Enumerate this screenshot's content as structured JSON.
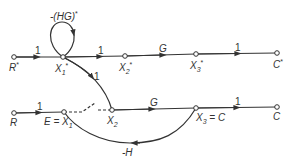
{
  "diagram": {
    "type": "signal-flow-graph",
    "top_graph": {
      "nodes": [
        {
          "id": "R*",
          "label": "R*"
        },
        {
          "id": "X1*",
          "label": "X1*"
        },
        {
          "id": "X2*",
          "label": "X2*"
        },
        {
          "id": "X3*",
          "label": "X3*"
        },
        {
          "id": "C*",
          "label": "C*"
        }
      ],
      "edges": [
        {
          "from": "R*",
          "to": "X1*",
          "gain": "1"
        },
        {
          "from": "X1*",
          "to": "X1*",
          "gain": "-(HG)*",
          "kind": "self-loop"
        },
        {
          "from": "X1*",
          "to": "X2*",
          "gain": "1"
        },
        {
          "from": "X2*",
          "to": "X3*",
          "gain": "G"
        },
        {
          "from": "X3*",
          "to": "C*",
          "gain": "1"
        },
        {
          "from": "X1*",
          "to": "X2",
          "gain": "1",
          "kind": "sampler-link"
        }
      ]
    },
    "bottom_graph": {
      "nodes": [
        {
          "id": "R",
          "label": "R"
        },
        {
          "id": "E=X1",
          "label": "E = X1"
        },
        {
          "id": "X2",
          "label": "X2"
        },
        {
          "id": "X3=C",
          "label": "X3 = C"
        },
        {
          "id": "C",
          "label": "C"
        }
      ],
      "edges": [
        {
          "from": "R",
          "to": "E=X1",
          "gain": "1"
        },
        {
          "from": "E=X1",
          "to": "X2",
          "gain": "",
          "kind": "sampler-switch-dashed"
        },
        {
          "from": "X2",
          "to": "X3=C",
          "gain": "G"
        },
        {
          "from": "X3=C",
          "to": "C",
          "gain": "1"
        },
        {
          "from": "X3=C",
          "to": "E=X1",
          "gain": "-H",
          "kind": "feedback"
        }
      ]
    },
    "labels": {
      "loop_gain": "-(HG)",
      "gain_1": "1",
      "gain_G": "G",
      "gain_negH": "-H",
      "R_star": "R",
      "X1_star": "X",
      "X2_star": "X",
      "X3_star": "X",
      "C_star": "C",
      "R": "R",
      "E_X1": "E = X",
      "X2": "X",
      "X3_C_prefix": "X",
      "X3_C_suffix": " = C",
      "C": "C",
      "star": "*",
      "sub1": "1",
      "sub2": "2",
      "sub3": "3"
    }
  }
}
